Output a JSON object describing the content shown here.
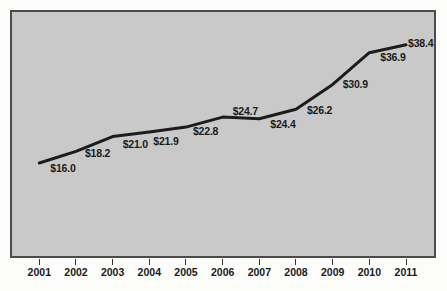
{
  "figure": {
    "background": "#fcfcfb"
  },
  "chart_data": {
    "type": "line",
    "title": "",
    "xlabel": "",
    "ylabel": "",
    "categories": [
      "2001",
      "2002",
      "2003",
      "2004",
      "2005",
      "2006",
      "2007",
      "2008",
      "2009",
      "2010",
      "2011"
    ],
    "values": [
      16.0,
      18.2,
      21.0,
      21.9,
      22.8,
      24.7,
      24.4,
      26.2,
      30.9,
      36.9,
      38.4
    ],
    "point_labels": [
      "$16.0",
      "$18.2",
      "$21.0",
      "$21.9",
      "$22.8",
      "$24.7",
      "$24.4",
      "$26.2",
      "$30.9",
      "$36.9",
      "$38.4"
    ],
    "ylim": [
      -2,
      45
    ],
    "grid": false,
    "legend": "none",
    "colors": {
      "line": "#1c1c1c",
      "plot_background": "#c9c9c9",
      "plot_border": "#4c4c4c",
      "label_text": "#1a1a1a",
      "axis_text": "#1a1a1a",
      "tick": "#333333"
    }
  }
}
